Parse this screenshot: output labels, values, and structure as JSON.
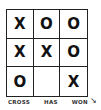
{
  "board": {
    "cells": [
      [
        "X",
        "O",
        "O"
      ],
      [
        "X",
        "X",
        "O"
      ],
      [
        "O",
        "",
        "X"
      ]
    ]
  },
  "caption": {
    "words": [
      "CROSS",
      "HAS",
      "WON"
    ]
  },
  "signature": "↘"
}
